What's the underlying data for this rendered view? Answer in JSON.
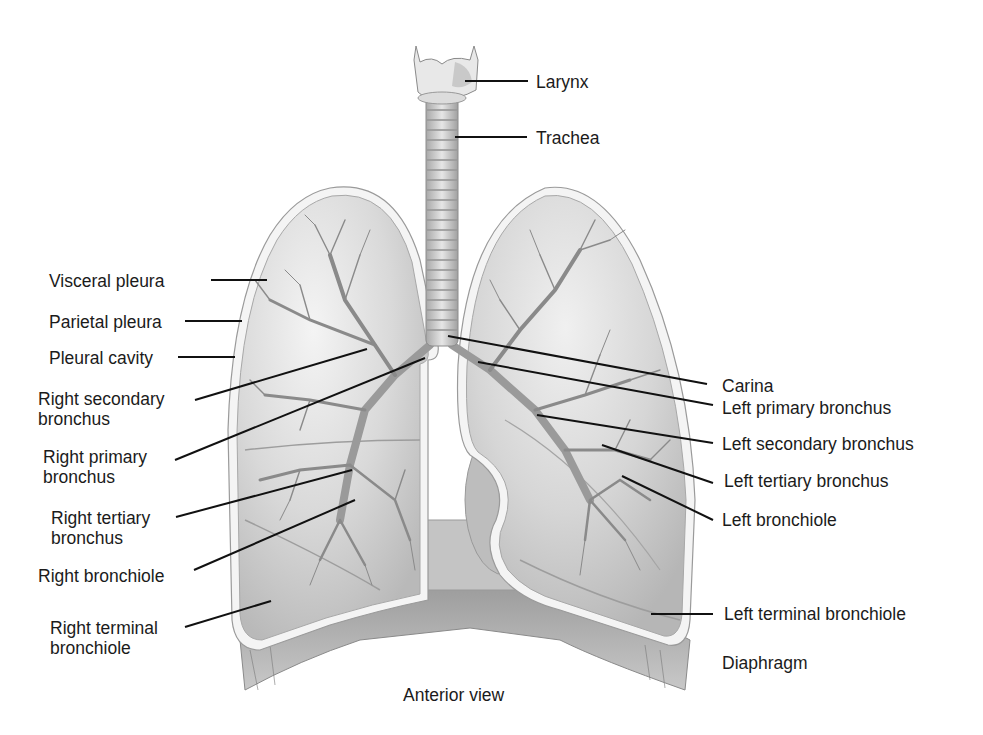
{
  "diagram": {
    "title": "Anterior view",
    "colors": {
      "background": "#ffffff",
      "lung_fill": "#d8d8d8",
      "pleura": "#f2f2f2",
      "outline": "#9a9a9a",
      "bronchi": "#8c8c8c",
      "leader_line": "#111111"
    },
    "labels": {
      "larynx": "Larynx",
      "trachea": "Trachea",
      "visceral_pleura": "Visceral pleura",
      "parietal_pleura": "Parietal pleura",
      "pleural_cavity": "Pleural cavity",
      "right_secondary_bronchus_1": "Right secondary",
      "right_secondary_bronchus_2": "bronchus",
      "right_primary_bronchus_1": "Right primary",
      "right_primary_bronchus_2": "bronchus",
      "right_tertiary_bronchus_1": "Right tertiary",
      "right_tertiary_bronchus_2": "bronchus",
      "right_bronchiole": "Right bronchiole",
      "right_terminal_bronchiole_1": "Right terminal",
      "right_terminal_bronchiole_2": "bronchiole",
      "carina": "Carina",
      "left_primary_bronchus": "Left primary bronchus",
      "left_secondary_bronchus": "Left secondary bronchus",
      "left_tertiary_bronchus": "Left tertiary bronchus",
      "left_bronchiole": "Left bronchiole",
      "left_terminal_bronchiole": "Left terminal bronchiole",
      "diaphragm": "Diaphragm",
      "caption": "Anterior view"
    }
  }
}
